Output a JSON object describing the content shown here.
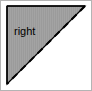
{
  "canvas": {
    "width": 92,
    "height": 91,
    "background_color": "#ffffff",
    "border_color": "#b4b4b4",
    "border_width": 1
  },
  "figure": {
    "type": "right-triangle",
    "fill_color": "#a0a0a0",
    "hatch_color": "#9a9a9a",
    "hatch_style": "fine-vertical-stripes",
    "outline_color": "#000000",
    "outline_width": 1,
    "right_angle_position": "top-left",
    "vertices": [
      {
        "name": "top-left",
        "x": 6,
        "y": 5
      },
      {
        "name": "top-right",
        "x": 84,
        "y": 5
      },
      {
        "name": "bottom-left",
        "x": 6,
        "y": 83
      }
    ],
    "hypotenuse": {
      "style": "dashed",
      "color": "#000000",
      "width": 2,
      "dash_pattern": "7 5",
      "from": {
        "x": 84,
        "y": 5
      },
      "to": {
        "x": 6,
        "y": 83
      }
    },
    "label": {
      "text": "right",
      "color": "#000000",
      "font_size": 11,
      "x": 13,
      "y": 24
    }
  }
}
